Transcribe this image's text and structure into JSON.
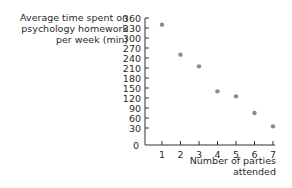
{
  "chart_data": {
    "type": "scatter",
    "title": "",
    "ylabel_lines": [
      "Average time spent on",
      "psychology homework",
      "per week (min)"
    ],
    "xlabel_lines": [
      "Number of parties",
      "attended"
    ],
    "ylabel": "Average time spent on psychology homework per week (min)",
    "xlabel": "Number of parties attended",
    "x": [
      1,
      2,
      3,
      4,
      5,
      6,
      7
    ],
    "values": [
      340,
      250,
      215,
      140,
      125,
      75,
      35
    ],
    "xticks": [
      "1",
      "2",
      "3",
      "4",
      "5",
      "6",
      "7"
    ],
    "yticks": [
      "0",
      "30",
      "60",
      "90",
      "120",
      "150",
      "180",
      "210",
      "240",
      "270",
      "300",
      "330",
      "360"
    ],
    "ylim": [
      0,
      360
    ],
    "xlim": [
      0,
      7
    ],
    "grid": false,
    "legend": null,
    "point_color": "#8a8a8a",
    "axis_color": "#333333"
  }
}
